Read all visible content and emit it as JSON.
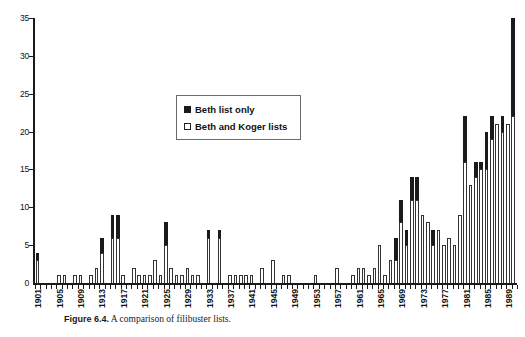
{
  "figure": {
    "caption_label": "Figure 6.4.",
    "caption_text": " A comparison of filibuster lists."
  },
  "legend": {
    "position": "upper-center",
    "entries": [
      {
        "label": "Beth list only",
        "color": "#1a1a1a",
        "swatch": "filled-square"
      },
      {
        "label": "Beth and Koger lists",
        "color": "#ffffff",
        "swatch": "open-square"
      }
    ]
  },
  "axes": {
    "y_ticks": [
      "0",
      "5",
      "10",
      "15",
      "20",
      "25",
      "30",
      "35"
    ],
    "y_min": 0,
    "y_max": 35,
    "y_step": 5,
    "x_tick_labels": [
      "1901",
      "1905",
      "1909",
      "1913",
      "1917",
      "1921",
      "1925",
      "1929",
      "1933",
      "1937",
      "1941",
      "1945",
      "1949",
      "1953",
      "1957",
      "1961",
      "1965",
      "1969",
      "1973",
      "1977",
      "1981",
      "1985",
      "1989"
    ],
    "x_label_step": 4
  },
  "chart_data": {
    "type": "bar",
    "stacked": true,
    "title": "",
    "xlabel": "",
    "ylabel": "",
    "ylim": [
      0,
      35
    ],
    "grid": false,
    "legend_position": "upper-center",
    "categories": [
      "1901",
      "1902",
      "1903",
      "1904",
      "1905",
      "1906",
      "1907",
      "1908",
      "1909",
      "1910",
      "1911",
      "1912",
      "1913",
      "1914",
      "1915",
      "1916",
      "1917",
      "1918",
      "1919",
      "1920",
      "1921",
      "1922",
      "1923",
      "1924",
      "1925",
      "1926",
      "1927",
      "1928",
      "1929",
      "1930",
      "1931",
      "1932",
      "1933",
      "1934",
      "1935",
      "1936",
      "1937",
      "1938",
      "1939",
      "1940",
      "1941",
      "1942",
      "1943",
      "1944",
      "1945",
      "1946",
      "1947",
      "1948",
      "1949",
      "1950",
      "1951",
      "1952",
      "1953",
      "1954",
      "1955",
      "1956",
      "1957",
      "1958",
      "1959",
      "1960",
      "1961",
      "1962",
      "1963",
      "1964",
      "1965",
      "1966",
      "1967",
      "1968",
      "1969",
      "1970",
      "1971",
      "1972",
      "1973",
      "1974",
      "1975",
      "1976",
      "1977",
      "1978",
      "1979",
      "1980",
      "1981",
      "1982",
      "1983",
      "1984",
      "1985",
      "1986",
      "1987",
      "1988",
      "1989",
      "1990"
    ],
    "series": [
      {
        "name": "Beth and Koger lists",
        "color": "#ffffff",
        "values": [
          3,
          0,
          0,
          0,
          1,
          1,
          0,
          1,
          1,
          0,
          1,
          2,
          4,
          0,
          6,
          6,
          1,
          0,
          2,
          1,
          1,
          1,
          3,
          1,
          5,
          2,
          1,
          1,
          2,
          1,
          1,
          0,
          6,
          0,
          6,
          0,
          1,
          1,
          1,
          1,
          1,
          0,
          2,
          0,
          3,
          0,
          1,
          1,
          0,
          0,
          0,
          0,
          1,
          0,
          0,
          0,
          2,
          0,
          0,
          1,
          2,
          2,
          1,
          2,
          5,
          1,
          3,
          3,
          8,
          5,
          11,
          11,
          9,
          8,
          5,
          7,
          5,
          6,
          5,
          9,
          16,
          13,
          14,
          15,
          15,
          19,
          21,
          20,
          21,
          22
        ]
      },
      {
        "name": "Beth list only",
        "color": "#1a1a1a",
        "values": [
          1,
          0,
          0,
          0,
          0,
          0,
          0,
          0,
          0,
          0,
          0,
          0,
          2,
          0,
          3,
          3,
          0,
          0,
          0,
          0,
          0,
          0,
          0,
          0,
          3,
          0,
          0,
          0,
          0,
          0,
          0,
          0,
          1,
          0,
          1,
          0,
          0,
          0,
          0,
          0,
          0,
          0,
          0,
          0,
          0,
          0,
          0,
          0,
          0,
          0,
          0,
          0,
          0,
          0,
          0,
          0,
          0,
          0,
          0,
          0,
          0,
          0,
          0,
          0,
          0,
          0,
          0,
          3,
          3,
          2,
          3,
          3,
          0,
          0,
          2,
          0,
          0,
          0,
          0,
          0,
          6,
          0,
          2,
          1,
          5,
          3,
          0,
          2,
          0,
          13
        ]
      }
    ]
  }
}
